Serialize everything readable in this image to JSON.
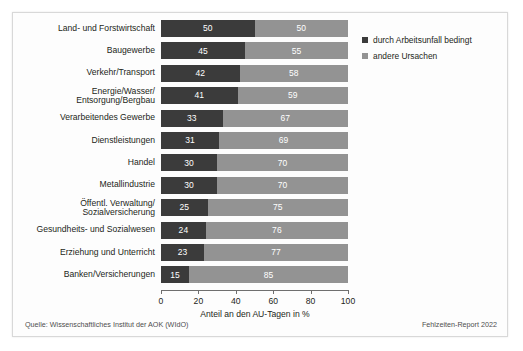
{
  "chart_data": {
    "type": "bar",
    "orientation": "horizontal",
    "stacked": true,
    "stacked_total": 100,
    "title": "",
    "xlabel": "Anteil an den AU-Tagen in %",
    "ylabel": "",
    "xlim": [
      0,
      100
    ],
    "xticks": [
      0,
      20,
      40,
      60,
      80,
      100
    ],
    "grid": false,
    "legend_position": "right-top",
    "categories": [
      "Land- und Forstwirtschaft",
      "Baugewerbe",
      "Verkehr/Transport",
      "Energie/Wasser/\nEntsorgung/Bergbau",
      "Verarbeitendes Gewerbe",
      "Dienstleistungen",
      "Handel",
      "Metallindustrie",
      "Öffentl. Verwaltung/\nSozialversicherung",
      "Gesundheits- und Sozialwesen",
      "Erziehung und Unterricht",
      "Banken/Versicherungen"
    ],
    "series": [
      {
        "name": "durch Arbeitsunfall bedingt",
        "color": "#3b3b3b",
        "values": [
          50,
          45,
          42,
          41,
          33,
          31,
          30,
          30,
          25,
          24,
          23,
          15
        ]
      },
      {
        "name": "andere Ursachen",
        "color": "#939393",
        "values": [
          50,
          55,
          58,
          59,
          67,
          69,
          70,
          70,
          75,
          76,
          77,
          85
        ]
      }
    ]
  },
  "legend": {
    "items": [
      {
        "label": "durch Arbeitsunfall bedingt",
        "color": "#3b3b3b"
      },
      {
        "label": "andere Ursachen",
        "color": "#939393"
      }
    ]
  },
  "axis": {
    "x_title": "Anteil an den AU-Tagen in %",
    "x_tick_labels": [
      "0",
      "20",
      "40",
      "60",
      "80",
      "100"
    ]
  },
  "footer": {
    "source": "Quelle: Wissenschaftliches Institut der AOK (WIdO)",
    "report": "Fehlzeiten-Report 2022"
  }
}
